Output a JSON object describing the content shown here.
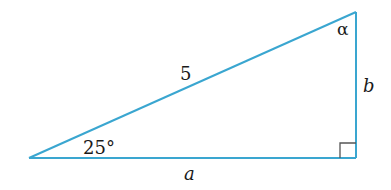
{
  "diagram": {
    "type": "right-triangle",
    "colors": {
      "edge": "#3aa6d0",
      "right_angle_mark": "#555555",
      "text": "#1a1a1a",
      "background": "#ffffff"
    },
    "vertices": {
      "left": {
        "x": 29,
        "y": 158
      },
      "bottom_right": {
        "x": 356,
        "y": 158
      },
      "top_right": {
        "x": 356,
        "y": 12
      }
    },
    "labels": {
      "hypotenuse": "5",
      "angle_left": "25°",
      "angle_top": "α",
      "side_bottom": "a",
      "side_right": "b"
    },
    "right_angle": {
      "at": "bottom_right",
      "size": 16
    }
  }
}
